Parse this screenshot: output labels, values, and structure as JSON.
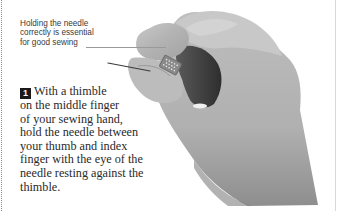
{
  "caption": {
    "lines": [
      "Holding the needle",
      "correctly is essential",
      "for good sewing"
    ]
  },
  "step": {
    "number": "1",
    "lines": [
      "With a thimble",
      "on the middle finger",
      "of your sewing hand,",
      "hold the needle between",
      "your thumb and index",
      "finger with the eye of the",
      "needle resting against the",
      "thimble."
    ]
  },
  "photo": {
    "subject": "hand holding needle with thimble on middle finger",
    "tone": "grayscale"
  },
  "colors": {
    "background": "#ffffff",
    "text": "#2a2a2a",
    "step_badge": "#1a1a1a"
  }
}
